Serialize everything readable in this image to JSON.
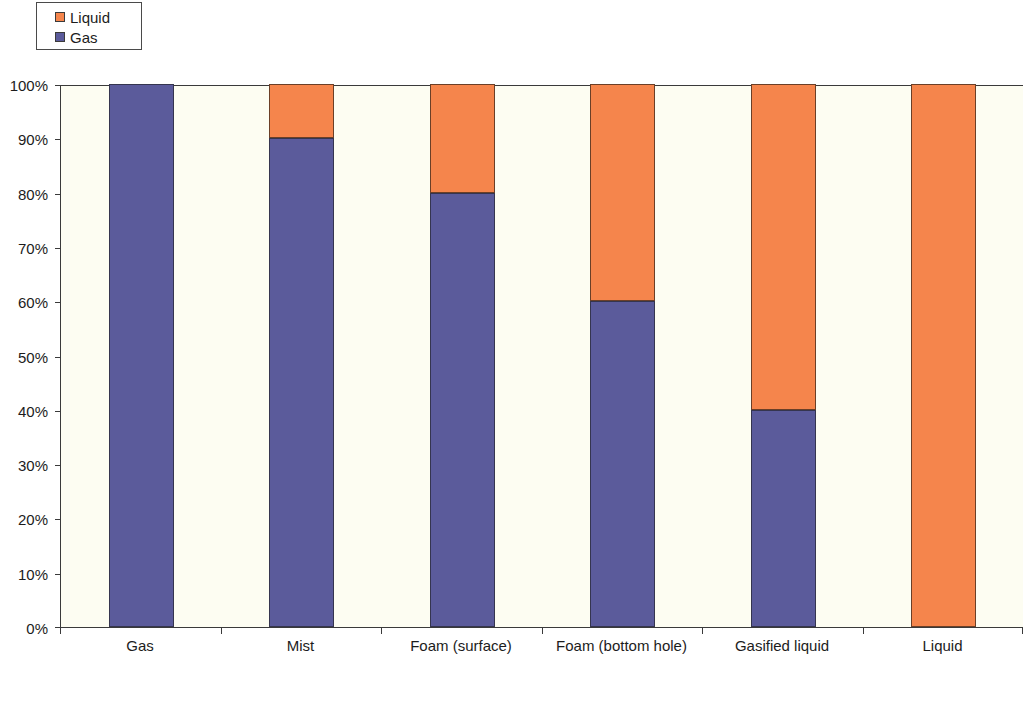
{
  "legend": {
    "position": "top-left",
    "entries": [
      {
        "label": "Liquid",
        "color": "#f5854c",
        "icon": "square-swatch-icon"
      },
      {
        "label": "Gas",
        "color": "#5b5b9b",
        "icon": "square-swatch-icon"
      }
    ]
  },
  "axis_caption": {
    "text": "Increasing Density",
    "icon": "right-arrow-icon"
  },
  "chart_data": {
    "type": "bar",
    "stacked": true,
    "stack_mode": "percent",
    "title": "",
    "subtitle": "",
    "xlabel": "Increasing Density",
    "ylabel": "",
    "ylim": [
      0,
      100
    ],
    "ytick_labels": [
      "0%",
      "10%",
      "20%",
      "30%",
      "40%",
      "50%",
      "60%",
      "70%",
      "80%",
      "90%",
      "100%"
    ],
    "ytick_values": [
      0,
      10,
      20,
      30,
      40,
      50,
      60,
      70,
      80,
      90,
      100
    ],
    "grid": false,
    "legend_position": "top-left",
    "categories": [
      "Gas",
      "Mist",
      "Foam (surface)",
      "Foam (bottom hole)",
      "Gasified liquid",
      "Liquid"
    ],
    "series": [
      {
        "name": "Liquid",
        "color": "#f5854c",
        "values": [
          0,
          10,
          20,
          40,
          60,
          100
        ]
      },
      {
        "name": "Gas",
        "color": "#5b5b9b",
        "values": [
          100,
          90,
          80,
          60,
          40,
          0
        ]
      }
    ],
    "annotations": [
      {
        "text": "Increasing Density",
        "position": "below-x-axis",
        "style": "bold"
      }
    ]
  }
}
